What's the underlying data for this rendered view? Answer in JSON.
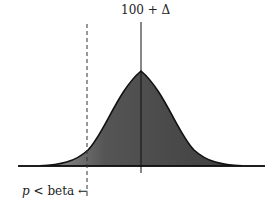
{
  "diagram": {
    "type": "normal-distribution-shaded",
    "top_label": "100 + Δ",
    "bottom_label": {
      "variable": "p",
      "text": "< beta",
      "arrow": "←"
    },
    "colors": {
      "fill_dark": "#3a3a3a",
      "fill_light": "#9a9a9a",
      "line": "#111111"
    }
  }
}
